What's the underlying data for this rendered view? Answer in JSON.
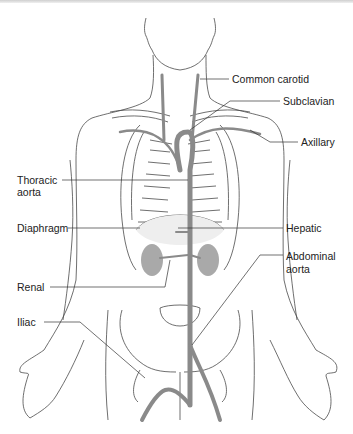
{
  "diagram": {
    "colors": {
      "artery": "#8a8a8a",
      "artery_light": "#bdbdbd",
      "outline": "#4a4a4a",
      "kidney": "#a9a9a9",
      "liver_fill": "#e6e6e6",
      "text": "#222222"
    },
    "labels": {
      "common_carotid": "Common carotid",
      "subclavian": "Subclavian",
      "axillary": "Axillary",
      "thoracic_aorta_1": "Thoracic",
      "thoracic_aorta_2": "aorta",
      "diaphragm": "Diaphragm",
      "hepatic": "Hepatic",
      "abdominal_aorta_1": "Abdominal",
      "abdominal_aorta_2": "aorta",
      "renal": "Renal",
      "iliac": "Iliac"
    }
  }
}
